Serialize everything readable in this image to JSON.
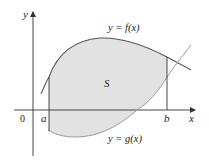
{
  "figure": {
    "type": "area-between-curves",
    "region_label": "S",
    "upper_curve_label": "y = f(x)",
    "lower_curve_label": "y = g(x)",
    "x_axis_label": "x",
    "y_axis_label": "y",
    "origin_label": "0",
    "left_bound_label": "a",
    "right_bound_label": "b"
  },
  "colors": {
    "region_fill": "#e2e2e2",
    "upper_curve": "#555555",
    "lower_curve": "#999999",
    "axes": "#333333",
    "bounds": "#333333"
  }
}
